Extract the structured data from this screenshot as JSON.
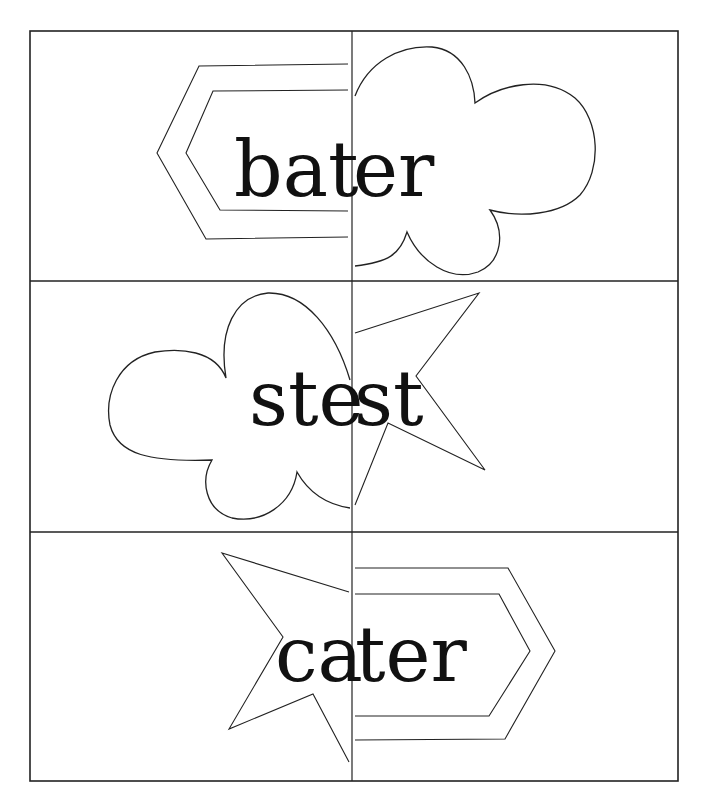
{
  "worksheet": {
    "grid": {
      "rows": 3,
      "columns": 2,
      "line_color": "#222222",
      "background": "#ffffff"
    },
    "cards": [
      {
        "row": 1,
        "word": "bater",
        "left_part": "bat",
        "right_part": "er",
        "left_shape": "hexagon-arrow-left",
        "right_shape": "cloud"
      },
      {
        "row": 2,
        "word": "stest",
        "left_part": "ste",
        "right_part": "st",
        "left_shape": "cloud",
        "right_shape": "star"
      },
      {
        "row": 3,
        "word": "cater",
        "left_part": "ca",
        "right_part": "ter",
        "left_shape": "star",
        "right_shape": "hexagon-arrow-right"
      }
    ]
  }
}
